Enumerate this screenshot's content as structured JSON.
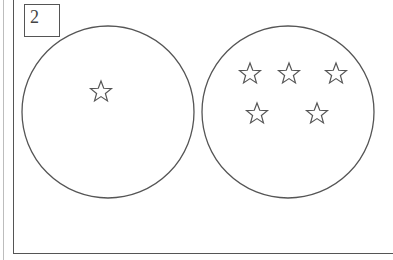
{
  "diagram": {
    "label": "2",
    "stroke_color": "#555555",
    "circles": [
      {
        "name": "left-circle",
        "cx": 108,
        "cy": 112,
        "r": 86,
        "stars": [
          {
            "x": 101,
            "y": 91
          }
        ]
      },
      {
        "name": "right-circle",
        "cx": 288,
        "cy": 112,
        "r": 86,
        "stars": [
          {
            "x": 250,
            "y": 73
          },
          {
            "x": 289,
            "y": 73
          },
          {
            "x": 336,
            "y": 73
          },
          {
            "x": 257,
            "y": 113
          },
          {
            "x": 317,
            "y": 113
          }
        ]
      }
    ],
    "star_size": 22
  }
}
